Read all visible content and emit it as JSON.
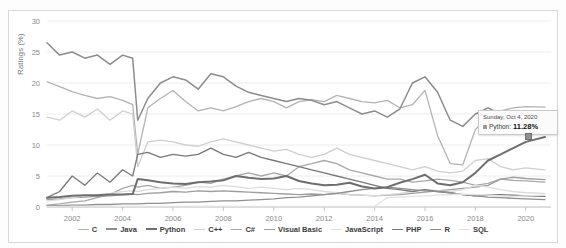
{
  "chart_data": {
    "type": "line",
    "title": "",
    "xlabel": "",
    "ylabel": "Ratings (%)",
    "xlim": [
      2001.0,
      2021.0
    ],
    "ylim": [
      0,
      30
    ],
    "yticks": [
      0,
      5,
      10,
      15,
      20,
      25,
      30
    ],
    "xticks": [
      2002,
      2004,
      2006,
      2008,
      2010,
      2012,
      2014,
      2016,
      2018,
      2020
    ],
    "grid": "horizontal",
    "legend_position": "bottom",
    "x": [
      2001.0,
      2001.5,
      2002.0,
      2002.5,
      2003.0,
      2003.5,
      2004.0,
      2004.4,
      2004.6,
      2005.0,
      2005.5,
      2006.0,
      2006.5,
      2007.0,
      2007.5,
      2008.0,
      2008.5,
      2009.0,
      2009.5,
      2010.0,
      2010.5,
      2011.0,
      2011.5,
      2012.0,
      2012.5,
      2013.0,
      2013.5,
      2014.0,
      2014.5,
      2015.0,
      2015.5,
      2016.0,
      2016.5,
      2017.0,
      2017.5,
      2018.0,
      2018.5,
      2019.0,
      2019.5,
      2020.0,
      2020.76
    ],
    "series": [
      {
        "name": "C",
        "color": "#b3b3b3",
        "width": 1.3,
        "values": [
          20.2,
          19.4,
          18.6,
          18.0,
          17.5,
          17.8,
          17.2,
          16.5,
          8.5,
          16.0,
          17.5,
          18.8,
          17.0,
          15.5,
          16.0,
          15.5,
          16.2,
          17.0,
          17.5,
          17.0,
          16.0,
          17.0,
          17.3,
          17.0,
          18.0,
          17.5,
          17.0,
          16.8,
          17.2,
          16.0,
          16.5,
          18.8,
          11.5,
          7.0,
          6.8,
          12.5,
          14.5,
          15.5,
          16.0,
          16.2,
          16.1
        ]
      },
      {
        "name": "Java",
        "color": "#8c8c8c",
        "width": 1.5,
        "values": [
          26.5,
          24.5,
          25.0,
          24.0,
          24.5,
          23.0,
          24.5,
          24.0,
          14.0,
          17.5,
          20.0,
          21.0,
          20.5,
          19.0,
          21.5,
          21.0,
          19.5,
          18.5,
          18.0,
          17.5,
          17.0,
          17.5,
          17.2,
          16.5,
          17.0,
          16.0,
          15.0,
          15.5,
          14.5,
          15.8,
          20.0,
          21.0,
          18.5,
          14.0,
          13.0,
          15.0,
          16.0,
          15.0,
          14.5,
          13.0,
          12.6
        ]
      },
      {
        "name": "Python",
        "color": "#6e6e6e",
        "width": 2.0,
        "values": [
          1.5,
          1.6,
          1.8,
          1.9,
          1.9,
          2.0,
          2.0,
          2.1,
          4.5,
          4.3,
          4.0,
          3.8,
          3.7,
          4.0,
          4.1,
          4.3,
          5.0,
          4.7,
          4.5,
          4.6,
          5.0,
          4.2,
          3.8,
          3.5,
          3.6,
          3.9,
          3.3,
          3.0,
          3.2,
          3.9,
          4.5,
          5.2,
          3.8,
          3.5,
          4.0,
          5.5,
          7.5,
          8.5,
          9.5,
          10.5,
          11.28
        ]
      },
      {
        "name": "C++",
        "color": "#cfcfcf",
        "width": 1.3,
        "values": [
          14.5,
          14.0,
          15.5,
          14.5,
          15.8,
          14.0,
          15.5,
          15.0,
          6.5,
          10.5,
          10.8,
          10.5,
          10.0,
          9.8,
          10.5,
          11.0,
          10.5,
          10.0,
          9.5,
          9.0,
          9.3,
          8.5,
          8.0,
          8.5,
          9.5,
          8.5,
          8.0,
          7.5,
          7.0,
          6.5,
          6.0,
          6.5,
          5.8,
          5.5,
          5.8,
          7.5,
          7.8,
          6.5,
          6.0,
          6.3,
          6.0
        ]
      },
      {
        "name": "C#",
        "color": "#a8a8a8",
        "width": 1.3,
        "values": [
          0.3,
          0.5,
          0.8,
          1.0,
          1.5,
          2.0,
          3.0,
          3.5,
          3.2,
          3.5,
          3.0,
          3.2,
          3.5,
          4.0,
          3.8,
          4.5,
          5.0,
          5.5,
          5.0,
          5.5,
          5.0,
          6.5,
          7.0,
          7.5,
          7.0,
          6.0,
          5.5,
          5.0,
          4.5,
          4.5,
          4.0,
          4.2,
          4.5,
          4.3,
          4.0,
          3.5,
          3.8,
          4.5,
          4.3,
          4.2,
          4.0
        ]
      },
      {
        "name": "Visual Basic",
        "color": "#9e9e9e",
        "width": 1.3,
        "values": [
          1.2,
          1.3,
          1.5,
          1.6,
          1.7,
          1.8,
          2.0,
          2.1,
          2.0,
          2.2,
          2.3,
          2.5,
          2.4,
          2.6,
          2.5,
          2.6,
          2.5,
          2.4,
          2.3,
          2.2,
          2.1,
          2.0,
          2.1,
          2.0,
          2.2,
          2.0,
          1.9,
          1.8,
          1.9,
          2.0,
          2.2,
          2.4,
          2.6,
          2.8,
          3.0,
          3.2,
          3.5,
          4.5,
          4.8,
          4.6,
          4.4
        ]
      },
      {
        "name": "JavaScript",
        "color": "#dcdcdc",
        "width": 1.3,
        "values": [
          1.0,
          1.2,
          1.5,
          1.8,
          2.0,
          2.2,
          2.5,
          2.6,
          2.5,
          2.8,
          3.0,
          3.2,
          3.0,
          3.3,
          3.2,
          3.5,
          3.3,
          3.0,
          3.2,
          3.0,
          2.8,
          3.0,
          2.8,
          2.5,
          2.3,
          2.0,
          1.9,
          1.8,
          2.0,
          2.2,
          2.5,
          2.8,
          2.6,
          2.5,
          2.8,
          3.5,
          3.2,
          2.8,
          2.5,
          2.3,
          2.2
        ]
      },
      {
        "name": "PHP",
        "color": "#787878",
        "width": 1.3,
        "values": [
          1.5,
          2.5,
          5.0,
          3.5,
          5.5,
          4.0,
          6.0,
          5.0,
          8.5,
          8.8,
          8.0,
          8.5,
          8.2,
          8.5,
          9.5,
          8.5,
          8.0,
          8.8,
          8.0,
          7.5,
          7.0,
          6.5,
          6.0,
          5.5,
          5.0,
          4.5,
          4.0,
          3.5,
          3.0,
          2.8,
          2.5,
          2.8,
          2.5,
          2.3,
          2.0,
          1.8,
          1.9,
          2.0,
          1.9,
          1.8,
          1.7
        ]
      },
      {
        "name": "R",
        "color": "#8f8f8f",
        "width": 1.3,
        "values": [
          0.2,
          0.2,
          0.3,
          0.3,
          0.4,
          0.4,
          0.5,
          0.5,
          0.5,
          0.6,
          0.6,
          0.7,
          0.8,
          0.8,
          0.9,
          1.0,
          1.0,
          1.1,
          1.2,
          1.3,
          1.5,
          1.6,
          1.8,
          2.0,
          2.2,
          2.5,
          2.8,
          3.0,
          3.2,
          3.0,
          2.8,
          2.6,
          2.5,
          2.3,
          2.0,
          1.8,
          1.6,
          1.5,
          1.4,
          1.3,
          1.2
        ]
      },
      {
        "name": "SQL",
        "color": "#e2e2e2",
        "width": 1.3,
        "values": [
          0.1,
          0.1,
          0.1,
          0.1,
          0.1,
          0.1,
          0.1,
          0.1,
          0.1,
          0.1,
          0.1,
          0.1,
          0.1,
          0.1,
          0.1,
          0.1,
          0.1,
          0.1,
          0.1,
          0.1,
          0.1,
          0.1,
          0.1,
          0.1,
          0.1,
          0.1,
          0.1,
          0.1,
          1.5,
          1.6,
          1.7,
          1.8,
          1.9,
          2.0,
          2.1,
          2.0,
          1.9,
          1.8,
          1.7,
          1.8,
          1.9
        ]
      }
    ],
    "annotation": {
      "date": "Sunday, Oct 4, 2020",
      "series": "Python:",
      "value": "11.28%",
      "point": {
        "x": 2020.76,
        "y": 11.28
      }
    }
  }
}
